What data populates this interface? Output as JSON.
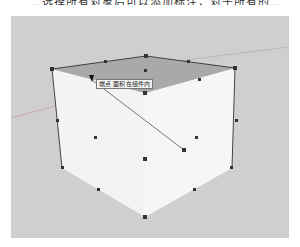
{
  "caption": {
    "text": "…选择所有对象后可以添加标注，对于所有的…"
  },
  "viewport": {
    "background": "#cfcfcf",
    "object": "cube",
    "colors": {
      "top_face": "#a9a9a9",
      "side_face": "#f3f3f3",
      "edge": "#333333",
      "axis_red": "#c9a2a2",
      "axis_green": "#a9c2a9"
    }
  },
  "tooltip": {
    "text": "端点 面积 在组件内"
  },
  "cursor": {
    "icon": "pencil-cursor-icon"
  }
}
